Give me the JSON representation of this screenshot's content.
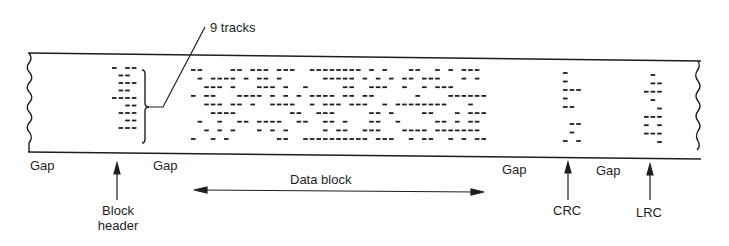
{
  "figure": {
    "colors": {
      "ink": "#1e1e1e",
      "background": "#ffffff"
    },
    "labels": {
      "tracks": "9 tracks",
      "gap_1": "Gap",
      "gap_2": "Gap",
      "gap_3": "Gap",
      "gap_4": "Gap",
      "data_block": "Data block",
      "block_header_line1": "Block",
      "block_header_line2": "header",
      "crc": "CRC",
      "lrc": "LRC"
    },
    "track_count": 9,
    "regions": [
      {
        "name": "block-header",
        "x0": 112,
        "x1": 136,
        "y0": 68,
        "y1": 128
      },
      {
        "name": "data-block",
        "x0": 191,
        "x1": 489,
        "y0": 70,
        "y1": 139
      },
      {
        "name": "crc",
        "x0": 563,
        "x1": 583,
        "y0": 73,
        "y1": 141
      },
      {
        "name": "lrc",
        "x0": 644,
        "x1": 664,
        "y0": 75,
        "y1": 142
      }
    ]
  }
}
